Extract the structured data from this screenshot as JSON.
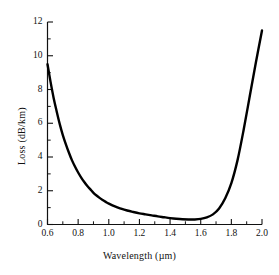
{
  "chart_data": {
    "type": "line",
    "title": "",
    "subtitle": "",
    "xlabel": "Wavelength (µm)",
    "ylabel": "Loss (dB/km)",
    "xlim": [
      0.6,
      2.0
    ],
    "ylim": [
      0,
      12
    ],
    "grid": false,
    "legend": null,
    "legend_position": "none",
    "xticks": [
      "0.6",
      "0.8",
      "1.0",
      "1.2",
      "1.4",
      "1.6",
      "1.8",
      "2.0"
    ],
    "xtick_values": [
      0.6,
      0.8,
      1.0,
      1.2,
      1.4,
      1.6,
      1.8,
      2.0
    ],
    "x_minor_ticks": [
      0.7,
      0.9,
      1.1,
      1.3,
      1.5,
      1.7,
      1.9
    ],
    "yticks": [
      "0",
      "2",
      "4",
      "6",
      "8",
      "10",
      "12"
    ],
    "ytick_values": [
      0,
      2,
      4,
      6,
      8,
      10,
      12
    ],
    "y_minor_ticks": [
      1,
      3,
      5,
      7,
      9,
      11
    ],
    "series": [
      {
        "name": "Fiber attenuation",
        "color": "#000000",
        "line_width": 2.4,
        "x": [
          0.6,
          0.62,
          0.64,
          0.66,
          0.68,
          0.7,
          0.72,
          0.74,
          0.76,
          0.78,
          0.8,
          0.82,
          0.84,
          0.86,
          0.88,
          0.9,
          0.92,
          0.94,
          0.96,
          0.98,
          1.0,
          1.04,
          1.08,
          1.12,
          1.16,
          1.2,
          1.24,
          1.28,
          1.32,
          1.36,
          1.4,
          1.44,
          1.48,
          1.52,
          1.56,
          1.6,
          1.64,
          1.68,
          1.72,
          1.76,
          1.8,
          1.84,
          1.88,
          1.92,
          1.96,
          2.0
        ],
        "y": [
          9.5,
          8.45,
          7.5,
          6.7,
          5.95,
          5.3,
          4.75,
          4.25,
          3.8,
          3.42,
          3.08,
          2.78,
          2.52,
          2.28,
          2.08,
          1.88,
          1.72,
          1.58,
          1.45,
          1.34,
          1.24,
          1.07,
          0.94,
          0.83,
          0.74,
          0.66,
          0.6,
          0.54,
          0.48,
          0.43,
          0.38,
          0.34,
          0.31,
          0.3,
          0.3,
          0.33,
          0.42,
          0.6,
          0.95,
          1.55,
          2.45,
          3.8,
          5.6,
          7.6,
          9.6,
          11.5
        ]
      }
    ]
  },
  "axes": {
    "x_axis_name": "wavelength-axis",
    "y_axis_name": "loss-axis"
  }
}
